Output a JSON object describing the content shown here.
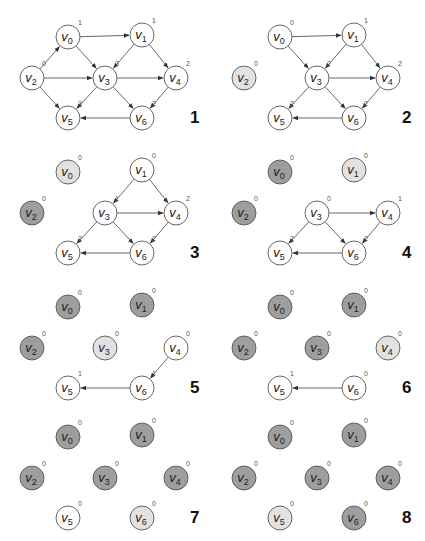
{
  "colors": {
    "unvisited": "#ffffff",
    "current": "#e2e2e2",
    "removed": "#9e9e9e",
    "stroke": "#555555",
    "edge": "#444444"
  },
  "layout": {
    "panel_origins": [
      [
        0,
        0
      ],
      [
        212,
        0
      ],
      [
        0,
        135
      ],
      [
        212,
        135
      ],
      [
        0,
        270
      ],
      [
        212,
        270
      ],
      [
        0,
        400
      ],
      [
        212,
        400
      ]
    ],
    "node_positions": {
      "v0": [
        68,
        37
      ],
      "v1": [
        142,
        35
      ],
      "v2": [
        32,
        78
      ],
      "v3": [
        105,
        78
      ],
      "v4": [
        176,
        78
      ],
      "v5": [
        68,
        118
      ],
      "v6": [
        142,
        118
      ]
    },
    "radius": 12,
    "step_label_pos": [
      190,
      123
    ]
  },
  "panels": [
    {
      "step": "1",
      "nodes": {
        "v0": {
          "state": "unvisited",
          "indeg": "1"
        },
        "v1": {
          "state": "unvisited",
          "indeg": "1"
        },
        "v2": {
          "state": "unvisited",
          "indeg": "0"
        },
        "v3": {
          "state": "unvisited",
          "indeg": "3"
        },
        "v4": {
          "state": "unvisited",
          "indeg": "2"
        },
        "v5": {
          "state": "unvisited",
          "indeg": "3"
        },
        "v6": {
          "state": "unvisited",
          "indeg": "2"
        }
      },
      "edges": [
        [
          "v2",
          "v0"
        ],
        [
          "v2",
          "v3"
        ],
        [
          "v2",
          "v5"
        ],
        [
          "v0",
          "v1"
        ],
        [
          "v0",
          "v3"
        ],
        [
          "v1",
          "v3"
        ],
        [
          "v1",
          "v4"
        ],
        [
          "v3",
          "v4"
        ],
        [
          "v3",
          "v5"
        ],
        [
          "v3",
          "v6"
        ],
        [
          "v4",
          "v6"
        ],
        [
          "v6",
          "v5"
        ]
      ]
    },
    {
      "step": "2",
      "nodes": {
        "v0": {
          "state": "unvisited",
          "indeg": "0"
        },
        "v1": {
          "state": "unvisited",
          "indeg": "1"
        },
        "v2": {
          "state": "current",
          "indeg": "0"
        },
        "v3": {
          "state": "unvisited",
          "indeg": "2"
        },
        "v4": {
          "state": "unvisited",
          "indeg": "2"
        },
        "v5": {
          "state": "unvisited",
          "indeg": "2"
        },
        "v6": {
          "state": "unvisited",
          "indeg": "2"
        }
      },
      "edges": [
        [
          "v0",
          "v1"
        ],
        [
          "v0",
          "v3"
        ],
        [
          "v1",
          "v3"
        ],
        [
          "v1",
          "v4"
        ],
        [
          "v3",
          "v4"
        ],
        [
          "v3",
          "v5"
        ],
        [
          "v3",
          "v6"
        ],
        [
          "v4",
          "v6"
        ],
        [
          "v6",
          "v5"
        ]
      ]
    },
    {
      "step": "3",
      "nodes": {
        "v0": {
          "state": "current",
          "indeg": "0"
        },
        "v1": {
          "state": "unvisited",
          "indeg": "0"
        },
        "v2": {
          "state": "removed",
          "indeg": "0"
        },
        "v3": {
          "state": "unvisited",
          "indeg": "1"
        },
        "v4": {
          "state": "unvisited",
          "indeg": "2"
        },
        "v5": {
          "state": "unvisited",
          "indeg": "2"
        },
        "v6": {
          "state": "unvisited",
          "indeg": "2"
        }
      },
      "edges": [
        [
          "v1",
          "v3"
        ],
        [
          "v1",
          "v4"
        ],
        [
          "v3",
          "v4"
        ],
        [
          "v3",
          "v5"
        ],
        [
          "v3",
          "v6"
        ],
        [
          "v4",
          "v6"
        ],
        [
          "v6",
          "v5"
        ]
      ]
    },
    {
      "step": "4",
      "nodes": {
        "v0": {
          "state": "removed",
          "indeg": "0"
        },
        "v1": {
          "state": "current",
          "indeg": "0"
        },
        "v2": {
          "state": "removed",
          "indeg": "0"
        },
        "v3": {
          "state": "unvisited",
          "indeg": "0"
        },
        "v4": {
          "state": "unvisited",
          "indeg": "1"
        },
        "v5": {
          "state": "unvisited",
          "indeg": "2"
        },
        "v6": {
          "state": "unvisited",
          "indeg": "2"
        }
      },
      "edges": [
        [
          "v3",
          "v4"
        ],
        [
          "v3",
          "v5"
        ],
        [
          "v3",
          "v6"
        ],
        [
          "v4",
          "v6"
        ],
        [
          "v6",
          "v5"
        ]
      ]
    },
    {
      "step": "5",
      "nodes": {
        "v0": {
          "state": "removed",
          "indeg": "0"
        },
        "v1": {
          "state": "removed",
          "indeg": "0"
        },
        "v2": {
          "state": "removed",
          "indeg": "0"
        },
        "v3": {
          "state": "current",
          "indeg": "0"
        },
        "v4": {
          "state": "unvisited",
          "indeg": "0"
        },
        "v5": {
          "state": "unvisited",
          "indeg": "1"
        },
        "v6": {
          "state": "unvisited",
          "indeg": "1"
        }
      },
      "edges": [
        [
          "v4",
          "v6"
        ],
        [
          "v6",
          "v5"
        ]
      ]
    },
    {
      "step": "6",
      "nodes": {
        "v0": {
          "state": "removed",
          "indeg": "0"
        },
        "v1": {
          "state": "removed",
          "indeg": "0"
        },
        "v2": {
          "state": "removed",
          "indeg": "0"
        },
        "v3": {
          "state": "removed",
          "indeg": "0"
        },
        "v4": {
          "state": "current",
          "indeg": "0"
        },
        "v5": {
          "state": "unvisited",
          "indeg": "1"
        },
        "v6": {
          "state": "unvisited",
          "indeg": "0"
        }
      },
      "edges": [
        [
          "v6",
          "v5"
        ]
      ]
    },
    {
      "step": "7",
      "nodes": {
        "v0": {
          "state": "removed",
          "indeg": "0"
        },
        "v1": {
          "state": "removed",
          "indeg": "0"
        },
        "v2": {
          "state": "removed",
          "indeg": "0"
        },
        "v3": {
          "state": "removed",
          "indeg": "0"
        },
        "v4": {
          "state": "removed",
          "indeg": "0"
        },
        "v5": {
          "state": "unvisited",
          "indeg": "0"
        },
        "v6": {
          "state": "current",
          "indeg": "0"
        }
      },
      "edges": []
    },
    {
      "step": "8",
      "nodes": {
        "v0": {
          "state": "removed",
          "indeg": "0"
        },
        "v1": {
          "state": "removed",
          "indeg": "0"
        },
        "v2": {
          "state": "removed",
          "indeg": "0"
        },
        "v3": {
          "state": "removed",
          "indeg": "0"
        },
        "v4": {
          "state": "removed",
          "indeg": "0"
        },
        "v5": {
          "state": "current",
          "indeg": "0"
        },
        "v6": {
          "state": "removed",
          "indeg": "0"
        }
      },
      "edges": []
    }
  ]
}
